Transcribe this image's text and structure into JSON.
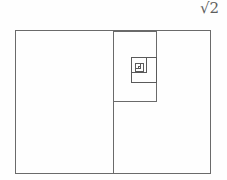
{
  "figure": {
    "name": "root-two-rectangle-spiral",
    "background_color": "#fefefe",
    "stroke_color": "#6a6a6a",
    "stroke_color_inner": "#5a5a5a",
    "stroke_width": 1,
    "label": {
      "text": "√2",
      "radicand": "2",
      "radical_symbol": "√",
      "color": "#5e5e5e",
      "position": "top-right"
    }
  },
  "chart_data": {
    "type": "diagram",
    "title": "√2",
    "canvas": {
      "width": 227,
      "height": 180
    },
    "outer_rectangle": {
      "x": 15,
      "y": 30,
      "width": 196,
      "height": 144,
      "aspect_ratio": 1.361
    },
    "divider_line": {
      "orientation": "vertical",
      "x": 113,
      "y1": 30,
      "y2": 174
    },
    "squares": [
      {
        "level": 1,
        "x": 113,
        "y": 31,
        "width": 44,
        "height": 71
      },
      {
        "level": 2,
        "x": 131,
        "y": 57,
        "width": 26,
        "height": 26
      },
      {
        "level": 3,
        "x": 131,
        "y": 57,
        "width": 16,
        "height": 16
      },
      {
        "level": 4,
        "x": 135,
        "y": 63,
        "width": 9,
        "height": 9
      },
      {
        "level": 5,
        "x": 135,
        "y": 63,
        "width": 6,
        "height": 6
      }
    ],
    "spiral_center": {
      "x": 139,
      "y": 67
    },
    "grid": false,
    "legend": false
  }
}
